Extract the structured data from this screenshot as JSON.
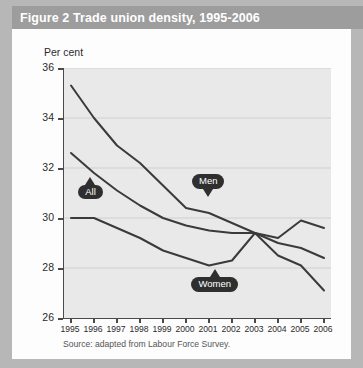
{
  "figure": {
    "title": "Figure 2 Trade union density, 1995-2006",
    "percent_label": "Per cent",
    "source": "Source: adapted from Labour Force Survey."
  },
  "labels": {
    "all": "All",
    "men": "Men",
    "women": "Women"
  },
  "colors": {
    "title_band": "#9d9d9d",
    "title_text": "#ffffff",
    "card": "#fdfdfd",
    "outer_frame": "#b7b7b7",
    "plot_background": "#e9e9e9",
    "axis": "#4a4a4a",
    "gridline": "#cfcfcf",
    "series_line": "#3a3a3a",
    "callout_fill": "#2f2f2f",
    "callout_text": "#ffffff"
  },
  "chart_data": {
    "type": "line",
    "title": "Figure 2 Trade union density, 1995-2006",
    "xlabel": "",
    "ylabel": "Per cent",
    "ylim": [
      26,
      36
    ],
    "yticks": [
      26,
      28,
      30,
      32,
      34,
      36
    ],
    "ytick_labels": [
      "26",
      "28",
      "30",
      "32",
      "34",
      "36"
    ],
    "grid": true,
    "legend": "annotations",
    "categories": [
      1995,
      1996,
      1997,
      1998,
      1999,
      2000,
      2001,
      2002,
      2003,
      2004,
      2005,
      2006
    ],
    "xtick_labels": [
      "1995",
      "1996",
      "1997",
      "1998",
      "1999",
      "2000",
      "2001",
      "2002",
      "2003",
      "2004",
      "2005",
      "2006"
    ],
    "series": [
      {
        "name": "Men",
        "values": [
          35.3,
          34.0,
          32.9,
          32.2,
          31.3,
          30.4,
          30.2,
          29.8,
          29.4,
          28.5,
          28.1,
          27.1
        ]
      },
      {
        "name": "All",
        "values": [
          32.6,
          31.8,
          31.1,
          30.5,
          30.0,
          29.7,
          29.5,
          29.4,
          29.4,
          29.0,
          28.8,
          28.4
        ]
      },
      {
        "name": "Women",
        "values": [
          30.0,
          30.0,
          29.6,
          29.2,
          28.7,
          28.4,
          28.1,
          28.3,
          29.4,
          29.2,
          29.9,
          29.6
        ]
      }
    ],
    "annotations": [
      {
        "text": "All",
        "x": 1995.9,
        "y": 31.2,
        "pointer": "up"
      },
      {
        "text": "Men",
        "x": 2001.0,
        "y": 31.3,
        "pointer": "down"
      },
      {
        "text": "Women",
        "x": 2001.3,
        "y": 27.5,
        "pointer": "up"
      }
    ],
    "source": "Source: adapted from Labour Force Survey."
  }
}
